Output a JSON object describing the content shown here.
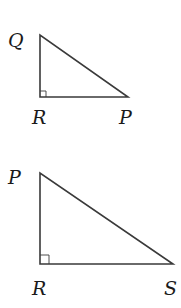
{
  "diagram": {
    "type": "right-triangles",
    "stroke_color": "#3a3a3a",
    "triangles": [
      {
        "name": "triangle-QRP",
        "right_angle_at": "R",
        "vertices": {
          "top": {
            "label": "Q",
            "x": 40,
            "y": 35
          },
          "right_angle": {
            "label": "R",
            "x": 40,
            "y": 97
          },
          "end": {
            "label": "P",
            "x": 128,
            "y": 97
          }
        }
      },
      {
        "name": "triangle-PRS",
        "right_angle_at": "R",
        "vertices": {
          "top": {
            "label": "P",
            "x": 40,
            "y": 173
          },
          "right_angle": {
            "label": "R",
            "x": 40,
            "y": 264
          },
          "end": {
            "label": "S",
            "x": 173,
            "y": 264
          }
        }
      }
    ]
  }
}
